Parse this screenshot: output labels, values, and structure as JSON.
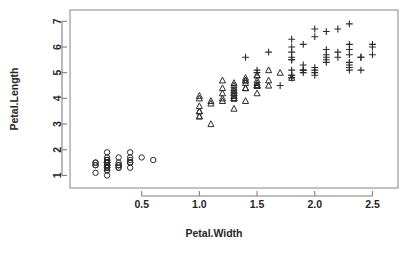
{
  "chart_data": {
    "type": "scatter",
    "title": "",
    "xlabel": "Petal.Width",
    "ylabel": "Petal.Length",
    "xlim": [
      0.0,
      2.6
    ],
    "ylim": [
      0.9,
      7.05
    ],
    "xticks": [
      "0.5",
      "1.0",
      "1.5",
      "2.0",
      "2.5"
    ],
    "xtick_values": [
      0.5,
      1.0,
      1.5,
      2.0,
      2.5
    ],
    "yticks": [
      "1",
      "2",
      "3",
      "4",
      "5",
      "6",
      "7"
    ],
    "ytick_values": [
      1,
      2,
      3,
      4,
      5,
      6,
      7
    ],
    "grid": false,
    "legend": "none",
    "series": [
      {
        "name": "setosa",
        "marker": "circle",
        "points": [
          [
            0.2,
            1.4
          ],
          [
            0.2,
            1.4
          ],
          [
            0.2,
            1.3
          ],
          [
            0.2,
            1.5
          ],
          [
            0.2,
            1.4
          ],
          [
            0.4,
            1.7
          ],
          [
            0.3,
            1.4
          ],
          [
            0.2,
            1.5
          ],
          [
            0.2,
            1.4
          ],
          [
            0.1,
            1.5
          ],
          [
            0.2,
            1.5
          ],
          [
            0.2,
            1.6
          ],
          [
            0.1,
            1.4
          ],
          [
            0.1,
            1.1
          ],
          [
            0.2,
            1.2
          ],
          [
            0.4,
            1.5
          ],
          [
            0.4,
            1.3
          ],
          [
            0.3,
            1.4
          ],
          [
            0.3,
            1.7
          ],
          [
            0.3,
            1.5
          ],
          [
            0.2,
            1.7
          ],
          [
            0.4,
            1.5
          ],
          [
            0.2,
            1.0
          ],
          [
            0.5,
            1.7
          ],
          [
            0.2,
            1.9
          ],
          [
            0.2,
            1.6
          ],
          [
            0.4,
            1.6
          ],
          [
            0.2,
            1.5
          ],
          [
            0.2,
            1.4
          ],
          [
            0.2,
            1.6
          ],
          [
            0.2,
            1.6
          ],
          [
            0.4,
            1.5
          ],
          [
            0.1,
            1.5
          ],
          [
            0.2,
            1.4
          ],
          [
            0.2,
            1.5
          ],
          [
            0.2,
            1.2
          ],
          [
            0.2,
            1.3
          ],
          [
            0.1,
            1.4
          ],
          [
            0.2,
            1.3
          ],
          [
            0.2,
            1.5
          ],
          [
            0.3,
            1.3
          ],
          [
            0.3,
            1.3
          ],
          [
            0.2,
            1.3
          ],
          [
            0.6,
            1.6
          ],
          [
            0.4,
            1.9
          ],
          [
            0.3,
            1.4
          ],
          [
            0.2,
            1.6
          ],
          [
            0.2,
            1.4
          ],
          [
            0.2,
            1.5
          ],
          [
            0.2,
            1.4
          ]
        ]
      },
      {
        "name": "versicolor",
        "marker": "triangle",
        "points": [
          [
            1.4,
            4.7
          ],
          [
            1.5,
            4.5
          ],
          [
            1.5,
            4.9
          ],
          [
            1.3,
            4.0
          ],
          [
            1.5,
            4.6
          ],
          [
            1.3,
            4.5
          ],
          [
            1.6,
            4.7
          ],
          [
            1.0,
            3.3
          ],
          [
            1.3,
            4.6
          ],
          [
            1.4,
            3.9
          ],
          [
            1.0,
            3.5
          ],
          [
            1.5,
            4.2
          ],
          [
            1.0,
            4.0
          ],
          [
            1.4,
            4.7
          ],
          [
            1.3,
            3.6
          ],
          [
            1.4,
            4.4
          ],
          [
            1.5,
            4.5
          ],
          [
            1.0,
            4.1
          ],
          [
            1.5,
            4.5
          ],
          [
            1.1,
            3.9
          ],
          [
            1.8,
            4.8
          ],
          [
            1.3,
            4.0
          ],
          [
            1.5,
            4.9
          ],
          [
            1.2,
            4.7
          ],
          [
            1.3,
            4.3
          ],
          [
            1.4,
            4.4
          ],
          [
            1.4,
            4.8
          ],
          [
            1.7,
            5.0
          ],
          [
            1.5,
            4.5
          ],
          [
            1.0,
            3.5
          ],
          [
            1.1,
            3.8
          ],
          [
            1.0,
            3.7
          ],
          [
            1.2,
            3.9
          ],
          [
            1.6,
            5.1
          ],
          [
            1.5,
            4.5
          ],
          [
            1.6,
            4.5
          ],
          [
            1.5,
            4.7
          ],
          [
            1.3,
            4.4
          ],
          [
            1.3,
            4.1
          ],
          [
            1.3,
            4.0
          ],
          [
            1.2,
            4.4
          ],
          [
            1.4,
            4.6
          ],
          [
            1.2,
            4.0
          ],
          [
            1.0,
            3.3
          ],
          [
            1.3,
            4.2
          ],
          [
            1.2,
            4.2
          ],
          [
            1.3,
            4.2
          ],
          [
            1.3,
            4.3
          ],
          [
            1.1,
            3.0
          ],
          [
            1.3,
            4.1
          ]
        ]
      },
      {
        "name": "virginica",
        "marker": "plus",
        "points": [
          [
            2.5,
            6.0
          ],
          [
            1.9,
            5.1
          ],
          [
            2.1,
            5.9
          ],
          [
            1.8,
            5.6
          ],
          [
            2.2,
            5.8
          ],
          [
            2.1,
            6.6
          ],
          [
            1.7,
            4.5
          ],
          [
            1.8,
            6.3
          ],
          [
            1.8,
            5.8
          ],
          [
            2.5,
            6.1
          ],
          [
            2.0,
            5.1
          ],
          [
            1.9,
            5.3
          ],
          [
            2.1,
            5.5
          ],
          [
            2.0,
            5.0
          ],
          [
            2.4,
            5.1
          ],
          [
            2.3,
            5.3
          ],
          [
            1.8,
            5.5
          ],
          [
            2.2,
            6.7
          ],
          [
            2.3,
            6.9
          ],
          [
            1.5,
            5.0
          ],
          [
            2.3,
            5.7
          ],
          [
            2.0,
            4.9
          ],
          [
            2.0,
            6.7
          ],
          [
            1.8,
            4.9
          ],
          [
            2.1,
            5.7
          ],
          [
            1.8,
            6.0
          ],
          [
            1.8,
            4.8
          ],
          [
            1.8,
            4.9
          ],
          [
            2.1,
            5.6
          ],
          [
            1.6,
            5.8
          ],
          [
            1.9,
            6.1
          ],
          [
            2.0,
            6.4
          ],
          [
            2.2,
            5.6
          ],
          [
            1.5,
            5.1
          ],
          [
            1.4,
            5.6
          ],
          [
            2.3,
            6.1
          ],
          [
            2.4,
            5.6
          ],
          [
            1.8,
            5.5
          ],
          [
            1.8,
            4.8
          ],
          [
            2.1,
            5.4
          ],
          [
            2.4,
            5.6
          ],
          [
            2.3,
            5.1
          ],
          [
            1.9,
            5.1
          ],
          [
            2.3,
            5.9
          ],
          [
            2.5,
            5.7
          ],
          [
            2.3,
            5.2
          ],
          [
            1.9,
            5.0
          ],
          [
            2.0,
            5.2
          ],
          [
            2.3,
            5.4
          ],
          [
            1.8,
            5.1
          ]
        ]
      }
    ]
  },
  "plot": {
    "frame": {
      "left": 70,
      "top": 10,
      "right": 398,
      "bottom": 188
    },
    "colors": {
      "marker": "#2b2b2b",
      "axis": "#808080",
      "frame": "#9a9a9a",
      "text": "#262626",
      "background": "#ffffff"
    }
  }
}
